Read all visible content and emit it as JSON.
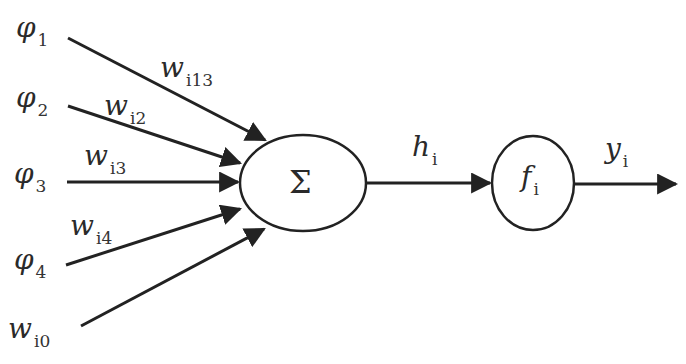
{
  "diagram": {
    "type": "neuron-model",
    "inputs": [
      {
        "symbol": "φ",
        "index": "1",
        "weight_symbol": "w",
        "weight_index": "i13"
      },
      {
        "symbol": "φ",
        "index": "2",
        "weight_symbol": "w",
        "weight_index": "i2"
      },
      {
        "symbol": "φ",
        "index": "3",
        "weight_symbol": "w",
        "weight_index": "i3"
      },
      {
        "symbol": "φ",
        "index": "4",
        "weight_symbol": "w",
        "weight_index": "i4"
      },
      {
        "symbol": "w",
        "index": "i0"
      }
    ],
    "summation_node": {
      "symbol": "Σ"
    },
    "activation_node": {
      "symbol": "f",
      "index": "i"
    },
    "intermediate_output": {
      "symbol": "h",
      "index": "i"
    },
    "final_output": {
      "symbol": "y",
      "index": "i"
    },
    "colors": {
      "stroke": "#222222",
      "background": "#ffffff",
      "text": "#2a2a2a"
    }
  }
}
